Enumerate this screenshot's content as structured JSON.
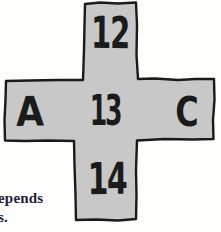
{
  "figure": {
    "cross": {
      "top_label": "12",
      "left_label": "A",
      "center_label": "13",
      "right_label": "C",
      "bottom_label": "14",
      "fill_color": "#c8c8c8",
      "outline_color": "#1a1a1a",
      "glyph_color": "#1b1b1b"
    },
    "caption_fragment": {
      "line1": "epends",
      "line2": "s."
    }
  }
}
